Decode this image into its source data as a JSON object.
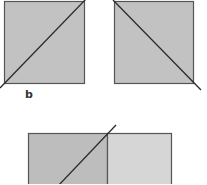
{
  "figure": {
    "panel_label": "b",
    "colors": {
      "square_fill": "#c2c2c2",
      "light_fill": "#d6d6d6",
      "stroke": "#555555",
      "diagonal": "#2a2a2a",
      "background": "#ffffff"
    },
    "shapes": [
      {
        "name": "left-square",
        "diagonal": "bottom-left to top-right"
      },
      {
        "name": "right-square",
        "diagonal": "top-left to bottom-right"
      },
      {
        "name": "bottom-rectangle",
        "parts": [
          "dark-left-half",
          "light-right-half"
        ],
        "diagonal": "crossing left half toward top divider"
      }
    ]
  }
}
